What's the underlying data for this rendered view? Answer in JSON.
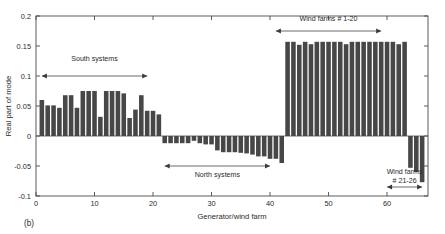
{
  "panel_label": "(b)",
  "colors": {
    "bar": "#474747",
    "axis": "#4a4a4a",
    "text": "#2b2b2b",
    "background": "#ffffff"
  },
  "chart_data": {
    "type": "bar",
    "title": "",
    "xlabel": "Generator/wind farm",
    "ylabel": "Real part of mode",
    "xlim": [
      0,
      67
    ],
    "ylim": [
      -0.1,
      0.2
    ],
    "grid": false,
    "legend": "none",
    "yticks": [
      -0.1,
      -0.05,
      0,
      0.05,
      0.1,
      0.15,
      0.2
    ],
    "ytick_labels": [
      "-0.1",
      "-0.05",
      "0",
      "0.05",
      "0.1",
      "0.15",
      "0.2"
    ],
    "xticks": [
      0,
      10,
      20,
      30,
      40,
      50,
      60
    ],
    "xtick_labels": [
      "0",
      "10",
      "20",
      "30",
      "40",
      "50",
      "60"
    ],
    "x": [
      1,
      2,
      3,
      4,
      5,
      6,
      7,
      8,
      9,
      10,
      11,
      12,
      13,
      14,
      15,
      16,
      17,
      18,
      19,
      20,
      21,
      22,
      23,
      24,
      25,
      26,
      27,
      28,
      29,
      30,
      31,
      32,
      33,
      34,
      35,
      36,
      37,
      38,
      39,
      40,
      41,
      42,
      43,
      44,
      45,
      46,
      47,
      48,
      49,
      50,
      51,
      52,
      53,
      54,
      55,
      56,
      57,
      58,
      59,
      60,
      61,
      62,
      63,
      64,
      65,
      66
    ],
    "values": [
      0.06,
      0.051,
      0.051,
      0.047,
      0.068,
      0.068,
      0.047,
      0.075,
      0.075,
      0.075,
      0.032,
      0.075,
      0.075,
      0.075,
      0.071,
      0.03,
      0.044,
      0.068,
      0.042,
      0.042,
      0.036,
      -0.012,
      -0.012,
      -0.012,
      -0.012,
      -0.012,
      -0.008,
      -0.012,
      -0.014,
      -0.014,
      -0.024,
      -0.027,
      -0.027,
      -0.027,
      -0.028,
      -0.029,
      -0.031,
      -0.034,
      -0.034,
      -0.038,
      -0.038,
      -0.045,
      0.157,
      0.157,
      0.152,
      0.157,
      0.153,
      0.157,
      0.157,
      0.157,
      0.157,
      0.157,
      0.153,
      0.157,
      0.157,
      0.157,
      0.157,
      0.157,
      0.157,
      0.157,
      0.157,
      0.153,
      0.157,
      -0.053,
      -0.06,
      -0.077
    ],
    "annotations": [
      {
        "name": "south-systems",
        "text": "South systems",
        "span_start": 1,
        "span_end": 19,
        "arrow_y": 0.1,
        "text_y": 0.125
      },
      {
        "name": "north-systems",
        "text": "North systems",
        "span_start": 22,
        "span_end": 40,
        "arrow_y": -0.05,
        "text_y": -0.068
      },
      {
        "name": "wind-farms-1-20",
        "text": "Wind farms # 1-20",
        "span_start": 41,
        "span_end": 59,
        "arrow_y": 0.175,
        "text_y": 0.192
      },
      {
        "name": "wind-farms-21-26",
        "text_line1": "Wind farms",
        "text_line2": "# 21-26",
        "span_start": 60,
        "span_end": 66,
        "arrow_y": -0.085,
        "text_y": -0.063
      }
    ]
  }
}
